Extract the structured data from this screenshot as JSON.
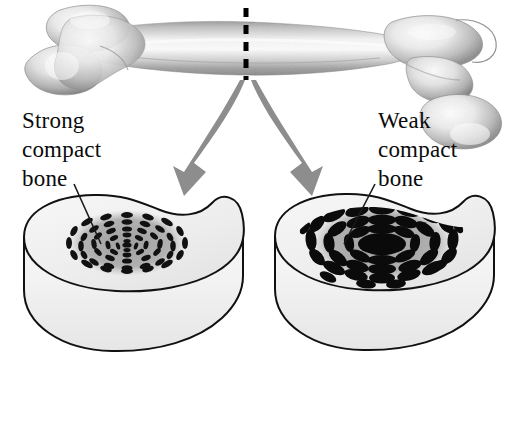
{
  "figure": {
    "background_color": "#ffffff",
    "width": 515,
    "height": 421
  },
  "bone": {
    "name": "femur",
    "description": "Long bone shown horizontally with condyles at left and head/greater trochanter at right",
    "cut_line": {
      "name": "cut-plane-dashed-line",
      "style": "dashed",
      "color": "#000000",
      "x": 245,
      "y_top": 8,
      "y_bottom": 80,
      "dash_count": 5
    }
  },
  "arrows": [
    {
      "name": "arrow-to-strong-section",
      "direction": "down-left",
      "color": "#8d8d8d",
      "from": [
        246,
        78
      ],
      "to": [
        185,
        196
      ]
    },
    {
      "name": "arrow-to-weak-section",
      "direction": "down-right",
      "color": "#8d8d8d",
      "from": [
        250,
        78
      ],
      "to": [
        305,
        196
      ]
    }
  ],
  "labels": {
    "strong": {
      "lines": [
        "Strong",
        "compact",
        "bone"
      ],
      "line1": "Strong",
      "line2": "compact",
      "line3": "bone",
      "x": 22,
      "y": 125,
      "leader_line": {
        "from": [
          73,
          186
        ],
        "to": [
          100,
          243
        ]
      }
    },
    "weak": {
      "lines": [
        "Weak",
        "compact",
        "bone"
      ],
      "line1": "Weak",
      "line2": "compact",
      "line3": "bone",
      "x": 378,
      "y": 125,
      "leader_line": {
        "from": [
          374,
          186
        ],
        "to": [
          343,
          243
        ]
      }
    }
  },
  "sections": [
    {
      "name": "strong-compact-bone-section",
      "label_ref": "strong",
      "side": "left",
      "center": [
        132,
        290
      ],
      "osteon": {
        "central_canal_size": "small",
        "central_canal_color": "#101010",
        "lacunae_size": "small",
        "lacunae_count": 78,
        "ring_count": 5,
        "halo_color": "#9a9a9a",
        "density": "high",
        "interpretation": "dense, tightly packed osteons indicate strong compact bone"
      },
      "block": {
        "top_face_color": "#eeeeee",
        "front_face_color": "#f2f2f2",
        "outline_color": "#111111"
      }
    },
    {
      "name": "weak-compact-bone-section",
      "label_ref": "weak",
      "side": "right",
      "center": [
        380,
        290
      ],
      "osteon": {
        "central_canal_size": "large",
        "central_canal_color": "#0a0a0a",
        "lacunae_size": "large",
        "lacunae_count": 62,
        "ring_count": 4,
        "halo_color": "#9a9a9a",
        "density": "low",
        "interpretation": "enlarged central canal and sparse coarse lacunae indicate weak compact bone"
      },
      "block": {
        "top_face_color": "#eeeeee",
        "front_face_color": "#f2f2f2",
        "outline_color": "#111111"
      }
    }
  ],
  "colors": {
    "ink": "#0b0b0b",
    "arrow_gray": "#8d8d8d",
    "bone_light": "#fbfbfb",
    "bone_mid": "#c9c9c9",
    "bone_dark": "#8f8f8f",
    "block_top": "#eeeeee",
    "block_front": "#f2f2f2",
    "halo": "#9a9a9a"
  }
}
